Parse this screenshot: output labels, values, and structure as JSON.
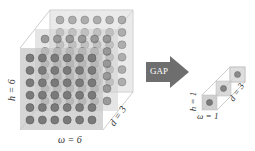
{
  "diagram": {
    "input": {
      "name": "feature-map",
      "width": 6,
      "height": 6,
      "depth": 3,
      "labels": {
        "w": "ω = 6",
        "h": "h = 6",
        "d": "d = 3"
      }
    },
    "operation": {
      "label": "GAP",
      "shape": "arrow"
    },
    "output": {
      "name": "pooled-vector",
      "width": 1,
      "height": 1,
      "depth": 3,
      "labels": {
        "w": "ω = 1",
        "h": "h = 1",
        "d": "d = 3"
      }
    },
    "colors": {
      "layer_fill": "#c8c8c8",
      "dot_fill": "#7a7a7a",
      "dot_stroke": "#5a5a5a",
      "edge": "#b0b0b0",
      "arrow_fill": "#6e6e6e",
      "text": "#333333"
    }
  }
}
